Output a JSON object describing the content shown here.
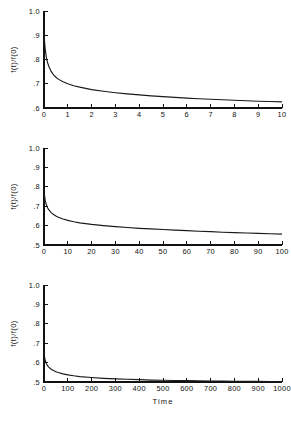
{
  "figure": {
    "background": "#ffffff",
    "ink_color": "#111111",
    "curve_color": "#1a1a1a",
    "x_axis_title": "Time",
    "y_axis_title": "f(t)/f(0)",
    "panel_count": 3
  },
  "chart_data": [
    {
      "type": "line",
      "title": "",
      "xlabel": "",
      "ylabel": "f(t)/f(0)",
      "xlim": [
        0,
        10
      ],
      "ylim": [
        0.6,
        1.0
      ],
      "grid": false,
      "legend": null,
      "xticks": [
        0,
        1,
        2,
        3,
        4,
        5,
        6,
        7,
        8,
        9,
        10
      ],
      "xticklabels": [
        "0",
        "1",
        "2",
        "3",
        "4",
        "5",
        "6",
        "7",
        "8",
        "9",
        "10"
      ],
      "yticks": [
        0.6,
        0.7,
        0.8,
        0.9,
        1.0
      ],
      "yticklabels": [
        ".6",
        ".7",
        ".8",
        ".9",
        "1.0"
      ],
      "series": [
        {
          "name": "f(t)/f(0)",
          "x": [
            0,
            0.02,
            0.05,
            0.1,
            0.15,
            0.2,
            0.3,
            0.4,
            0.5,
            0.6,
            0.8,
            1.0,
            1.25,
            1.5,
            1.75,
            2.0,
            2.5,
            3.0,
            3.5,
            4.0,
            4.5,
            5.0,
            5.5,
            6.0,
            6.5,
            7.0,
            7.5,
            8.0,
            8.5,
            9.0,
            9.5,
            10.0
          ],
          "y": [
            0.905,
            0.878,
            0.845,
            0.808,
            0.787,
            0.772,
            0.751,
            0.737,
            0.727,
            0.719,
            0.708,
            0.7,
            0.692,
            0.686,
            0.681,
            0.676,
            0.669,
            0.663,
            0.658,
            0.654,
            0.65,
            0.647,
            0.644,
            0.641,
            0.638,
            0.636,
            0.634,
            0.632,
            0.63,
            0.628,
            0.627,
            0.625
          ]
        }
      ]
    },
    {
      "type": "line",
      "title": "",
      "xlabel": "",
      "ylabel": "f(t)/f(0)",
      "xlim": [
        0,
        100
      ],
      "ylim": [
        0.5,
        1.0
      ],
      "grid": false,
      "legend": null,
      "xticks": [
        0,
        10,
        20,
        30,
        40,
        50,
        60,
        70,
        80,
        90,
        100
      ],
      "xticklabels": [
        "0",
        "10",
        "20",
        "30",
        "40",
        "50",
        "60",
        "70",
        "80",
        "90",
        "100"
      ],
      "yticks": [
        0.5,
        0.6,
        0.7,
        0.8,
        0.9,
        1.0
      ],
      "yticklabels": [
        ".5",
        ".6",
        ".7",
        ".8",
        ".9",
        "1.0"
      ],
      "series": [
        {
          "name": "f(t)/f(0)",
          "x": [
            0,
            0.2,
            0.5,
            1,
            1.5,
            2,
            3,
            4,
            5,
            6,
            8,
            10,
            12.5,
            15,
            20,
            25,
            30,
            35,
            40,
            45,
            50,
            55,
            60,
            65,
            70,
            75,
            80,
            85,
            90,
            95,
            100
          ],
          "y": [
            0.79,
            0.757,
            0.73,
            0.706,
            0.692,
            0.682,
            0.667,
            0.657,
            0.649,
            0.643,
            0.634,
            0.627,
            0.62,
            0.614,
            0.606,
            0.6,
            0.595,
            0.59,
            0.586,
            0.583,
            0.58,
            0.577,
            0.574,
            0.571,
            0.569,
            0.566,
            0.564,
            0.562,
            0.56,
            0.558,
            0.556
          ]
        }
      ]
    },
    {
      "type": "line",
      "title": "",
      "xlabel": "Time",
      "ylabel": "f(t)/f(0)",
      "xlim": [
        0,
        1000
      ],
      "ylim": [
        0.5,
        1.0
      ],
      "grid": false,
      "legend": null,
      "xticks": [
        0,
        100,
        200,
        300,
        400,
        500,
        600,
        700,
        800,
        900,
        1000
      ],
      "xticklabels": [
        "0",
        "100",
        "200",
        "300",
        "400",
        "500",
        "600",
        "700",
        "800",
        "900",
        "1000"
      ],
      "yticks": [
        0.5,
        0.6,
        0.7,
        0.8,
        0.9,
        1.0
      ],
      "yticklabels": [
        ".5",
        ".6",
        ".7",
        ".8",
        ".9",
        "1.0"
      ],
      "series": [
        {
          "name": "f(t)/f(0)",
          "x": [
            0,
            2,
            5,
            10,
            15,
            20,
            30,
            40,
            50,
            60,
            80,
            100,
            125,
            150,
            200,
            250,
            300,
            350,
            400,
            450,
            500,
            550,
            600,
            650,
            700,
            750,
            800,
            850,
            900,
            950,
            1000
          ],
          "y": [
            0.655,
            0.632,
            0.612,
            0.594,
            0.584,
            0.577,
            0.566,
            0.559,
            0.553,
            0.549,
            0.542,
            0.537,
            0.532,
            0.528,
            0.523,
            0.519,
            0.516,
            0.514,
            0.512,
            0.51,
            0.509,
            0.508,
            0.507,
            0.506,
            0.505,
            0.505,
            0.504,
            0.503,
            0.503,
            0.502,
            0.502
          ]
        }
      ]
    }
  ]
}
